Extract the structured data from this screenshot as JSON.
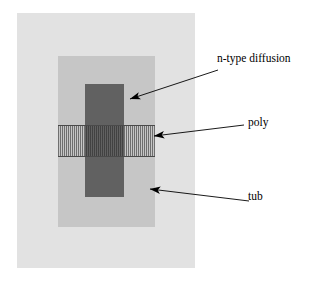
{
  "diagram": {
    "type": "layout-cross-section",
    "title": "",
    "background_color": "#ffffff",
    "width": 329,
    "height": 284,
    "layers": [
      {
        "name": "substrate-outer",
        "label": "",
        "fill": "#e2e2e2",
        "pattern": "solid",
        "x": 17,
        "y": 13,
        "width": 178,
        "height": 255
      },
      {
        "name": "tub",
        "label": "tub",
        "fill": "#c6c6c6",
        "pattern": "solid",
        "x": 58,
        "y": 56,
        "width": 97,
        "height": 171
      },
      {
        "name": "n-type-diffusion",
        "label": "n-type diffusion",
        "fill": "#616161",
        "pattern": "solid",
        "x": 85,
        "y": 84,
        "width": 39,
        "height": 113
      },
      {
        "name": "poly",
        "label": "poly",
        "fill": "#9a9a9a",
        "pattern": "vertical-hatch",
        "stroke": "#4a4a4a",
        "x": 58,
        "y": 125,
        "width": 97,
        "height": 32
      }
    ],
    "callouts": [
      {
        "name": "n-type-diffusion",
        "label": "n-type diffusion",
        "label_x": 217,
        "label_y": 52,
        "arrow_tail_x": 218,
        "arrow_tail_y": 70,
        "arrow_tip_x": 130,
        "arrow_tip_y": 99
      },
      {
        "name": "poly",
        "label": "poly",
        "label_x": 248,
        "label_y": 116,
        "arrow_tail_x": 244,
        "arrow_tail_y": 125,
        "arrow_tip_x": 154,
        "arrow_tip_y": 136
      },
      {
        "name": "tub",
        "label": "tub",
        "label_x": 248,
        "label_y": 190,
        "arrow_tail_x": 249,
        "arrow_tail_y": 201,
        "arrow_tip_x": 150,
        "arrow_tip_y": 189
      }
    ],
    "arrow_color": "#000000",
    "text_color": "#000000"
  }
}
